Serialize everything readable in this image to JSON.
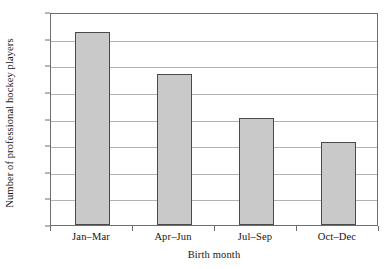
{
  "chart_data": {
    "type": "bar",
    "title": "",
    "xlabel": "Birth month",
    "ylabel": "Number of professional hockey players",
    "categories": [
      "Jan–Mar",
      "Apr–Jun",
      "Jul–Sep",
      "Oct–Dec"
    ],
    "values": [
      363,
      283,
      201,
      156
    ],
    "ylim": [
      0,
      400
    ],
    "yticks": [
      0,
      50,
      100,
      150,
      200,
      250,
      300,
      350,
      400
    ],
    "ytick_labels": [
      "0",
      "50",
      "100",
      "150",
      "200",
      "250",
      "300",
      "350",
      "400"
    ],
    "grid": true,
    "grid_axis": "y",
    "legend": null,
    "series": [
      {
        "name": "Professional hockey players",
        "values": [
          363,
          283,
          201,
          156
        ]
      }
    ],
    "colors": {
      "bar_fill": "#c9c9c9",
      "bar_edge": "#4a4a4a",
      "gridline": "#b2b2b2",
      "frame": "#6e6e6e",
      "text": "#141414",
      "background": "#ffffff"
    }
  }
}
